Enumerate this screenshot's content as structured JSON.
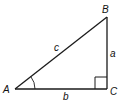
{
  "diagram": {
    "type": "right-triangle",
    "vertices": {
      "A": {
        "label": "A",
        "x": 15,
        "y": 89
      },
      "B": {
        "label": "B",
        "x": 107,
        "y": 17
      },
      "C": {
        "label": "C",
        "x": 107,
        "y": 89
      }
    },
    "sides": {
      "a": {
        "label": "a",
        "between": [
          "B",
          "C"
        ]
      },
      "b": {
        "label": "b",
        "between": [
          "A",
          "C"
        ]
      },
      "c": {
        "label": "c",
        "between": [
          "A",
          "B"
        ]
      }
    },
    "right_angle_at": "C",
    "marked_angle_at": "A",
    "colors": {
      "stroke": "#1a1a1a",
      "background": "#ffffff"
    }
  }
}
